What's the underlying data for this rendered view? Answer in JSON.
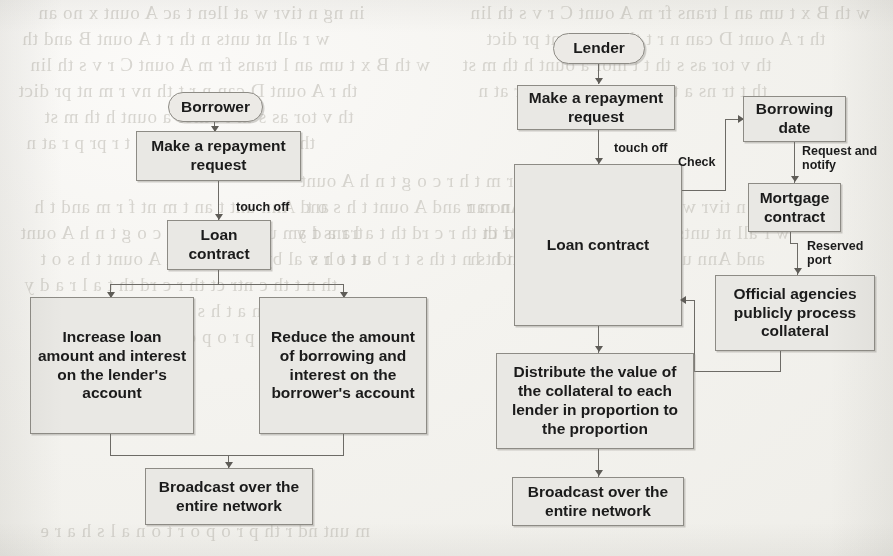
{
  "page": {
    "kind": "scanned-book-page",
    "paper_color": "#f4f3ef",
    "node_fill_color": "#e9e8e4",
    "node_border_color": "#8d8b85",
    "ink_color": "#1b1b1b",
    "connector_color": "#6d6b66"
  },
  "ghost_text": {
    "note": "faint mirrored show-through text bleeding from the reverse side of the page",
    "lines": [
      "in ng  n tivr  w  at llen   t ac    A  ount  x  no    an",
      "w  r  all  nt   unts  n  th  r   t   A  ount  B  and  th",
      "w  th  B  x  t  um  an  l   trans   fr m  A  ount  C  r  v  s  th  lin",
      "th  r   A  ount  D  can  n   r   t   th  nv  r  m  nt   pr  dict",
      "th  v  tor  as   s  th  t  t  mor   a  ount  h  th  m  st",
      "th  t  tr  ns  a  t    n  s  u  n  t   a  t  r  pr  p  r  at  n",
      "and  Ann  unt  t    an  t  m  nt  f  r  m  and  t  h",
      "trans   t  am  unt  f  r  m  t  h  r  c  o  g  t  n  h  A  ount",
      "a  t  o  r  v  al  by  An  m  r  and  A  ount  t  h  s  o  t",
      "th  n  t   th  c  ntr  ct  th  r  c  rd  th  t  a  l  r  a  d  y",
      "r  a  v  n  a  t  h  s  n  t  th  s  t  r  b  u  t  t  h  s",
      "m  unt  nd  r  th  p  r  o  p  o  r  t  o  n  a  l  s  h  a  r  e"
    ]
  },
  "charts": [
    {
      "id": "borrower-flow",
      "title": "Borrower repayment flow",
      "nodes": [
        {
          "id": "borrower",
          "label": "Borrower",
          "shape": "terminal"
        },
        {
          "id": "b-request",
          "label": "Make a repayment\nrequest",
          "shape": "process"
        },
        {
          "id": "b-loan-contract",
          "label": "Loan\ncontract",
          "shape": "process"
        },
        {
          "id": "b-increase",
          "label": "Increase loan\namount and interest\non the lender's\naccount",
          "shape": "process"
        },
        {
          "id": "b-reduce",
          "label": "Reduce the amount\nof borrowing and\ninterest on the\nborrower's account",
          "shape": "process"
        },
        {
          "id": "b-broadcast",
          "label": "Broadcast over the\nentire network",
          "shape": "process"
        }
      ],
      "edges": [
        {
          "from": "borrower",
          "to": "b-request",
          "label": ""
        },
        {
          "from": "b-request",
          "to": "b-loan-contract",
          "label": "touch off"
        },
        {
          "from": "b-loan-contract",
          "to": "b-increase",
          "label": ""
        },
        {
          "from": "b-loan-contract",
          "to": "b-reduce",
          "label": ""
        },
        {
          "from": "b-increase",
          "to": "b-broadcast",
          "label": ""
        },
        {
          "from": "b-reduce",
          "to": "b-broadcast",
          "label": ""
        }
      ]
    },
    {
      "id": "lender-flow",
      "title": "Lender repayment flow",
      "nodes": [
        {
          "id": "lender",
          "label": "Lender",
          "shape": "terminal"
        },
        {
          "id": "l-request",
          "label": "Make a repayment\nrequest",
          "shape": "process"
        },
        {
          "id": "l-loan-contract",
          "label": "Loan contract",
          "shape": "process"
        },
        {
          "id": "l-borrow-date",
          "label": "Borrowing\ndate",
          "shape": "process"
        },
        {
          "id": "l-mortgage",
          "label": "Mortgage\ncontract",
          "shape": "process"
        },
        {
          "id": "l-agencies",
          "label": "Official agencies\npublicly process\ncollateral",
          "shape": "process"
        },
        {
          "id": "l-distribute",
          "label": "Distribute the value of\nthe collateral to each\nlender in proportion to\nthe proportion",
          "shape": "process"
        },
        {
          "id": "l-broadcast",
          "label": "Broadcast over the\nentire network",
          "shape": "process"
        }
      ],
      "edges": [
        {
          "from": "lender",
          "to": "l-request",
          "label": ""
        },
        {
          "from": "l-request",
          "to": "l-loan-contract",
          "label": "touch off"
        },
        {
          "from": "l-loan-contract",
          "to": "l-borrow-date",
          "label": "Check"
        },
        {
          "from": "l-borrow-date",
          "to": "l-mortgage",
          "label": "Request and notify"
        },
        {
          "from": "l-mortgage",
          "to": "l-agencies",
          "label": "Reserved port"
        },
        {
          "from": "l-agencies",
          "to": "l-loan-contract",
          "label": ""
        },
        {
          "from": "l-loan-contract",
          "to": "l-distribute",
          "label": ""
        },
        {
          "from": "l-distribute",
          "to": "l-broadcast",
          "label": ""
        }
      ]
    }
  ],
  "labels": {
    "borrower": "Borrower",
    "lender": "Lender",
    "make_repayment_request": "Make a repayment\nrequest",
    "loan_contract_short": "Loan\ncontract",
    "loan_contract": "Loan contract",
    "increase_loan": "Increase loan\namount and interest\non the lender's\naccount",
    "reduce_amount": "Reduce the amount\nof borrowing and\ninterest on the\nborrower's account",
    "broadcast": "Broadcast over the\nentire network",
    "borrowing_date": "Borrowing\ndate",
    "mortgage_contract": "Mortgage\ncontract",
    "official_agencies": "Official agencies\npublicly process\ncollateral",
    "distribute_value": "Distribute the value of\nthe collateral to each\nlender in proportion to\nthe proportion",
    "touch_off": "touch off",
    "check": "Check",
    "request_and_notify": "Request and\nnotify",
    "reserved_port": "Reserved\nport"
  }
}
